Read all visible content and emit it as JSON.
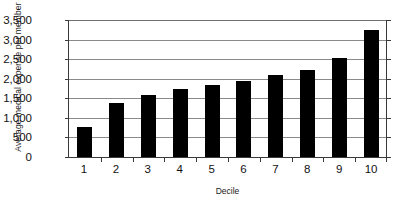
{
  "chart_data": {
    "type": "bar",
    "title": "",
    "xlabel": "Decile",
    "ylabel": "Average medical expense per member",
    "categories": [
      "1",
      "2",
      "3",
      "4",
      "5",
      "6",
      "7",
      "8",
      "9",
      "10"
    ],
    "values": [
      760,
      1380,
      1590,
      1730,
      1840,
      1940,
      2090,
      2230,
      2520,
      3250
    ],
    "series": [
      {
        "name": "Average medical expense per member",
        "values": [
          760,
          1380,
          1590,
          1730,
          1840,
          1940,
          2090,
          2230,
          2520,
          3250
        ]
      }
    ],
    "ylim": [
      0,
      3500
    ],
    "ytick_values": [
      0,
      500,
      1000,
      1500,
      2000,
      2500,
      3000,
      3500
    ],
    "ytick_labels": [
      "0",
      "500",
      "1,000",
      "1,500",
      "2,000",
      "2,500",
      "3,000",
      "3,500"
    ],
    "grid": true,
    "grid_axis": "y",
    "legend": false,
    "legend_position": "none",
    "bar_color": "#000000",
    "gridline_color": "#8a8a8a",
    "axis_color": "#3a3a3a",
    "background_color": "#ffffff"
  }
}
